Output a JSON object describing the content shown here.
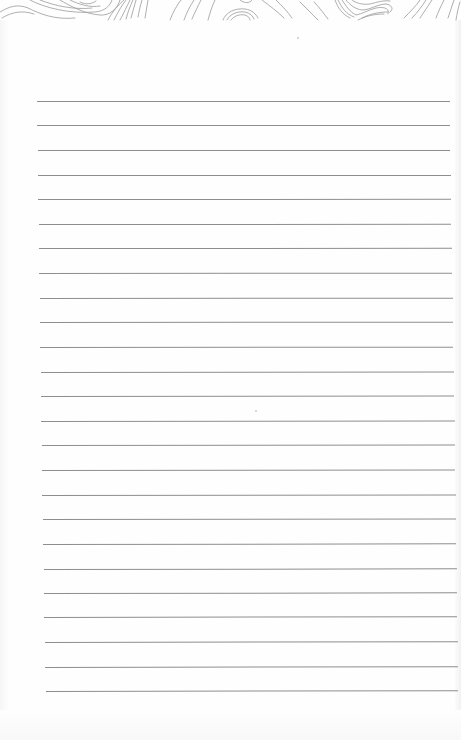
{
  "document": {
    "type": "lined-notebook-page",
    "background_color": "#fefefe",
    "line_color": "#8e8e8e",
    "header_pattern": "topographic-contour-lines",
    "header_pattern_color": "#9a9a9a",
    "ruled_line_count": 25,
    "ruled_lines": [
      {
        "y": 101,
        "x1": 37,
        "x2": 450
      },
      {
        "y": 125,
        "x1": 37,
        "x2": 450
      },
      {
        "y": 150,
        "x1": 38,
        "x2": 450
      },
      {
        "y": 175,
        "x1": 38,
        "x2": 451
      },
      {
        "y": 199,
        "x1": 38,
        "x2": 451
      },
      {
        "y": 224,
        "x1": 39,
        "x2": 451
      },
      {
        "y": 248,
        "x1": 39,
        "x2": 452
      },
      {
        "y": 273,
        "x1": 39,
        "x2": 452
      },
      {
        "y": 298,
        "x1": 40,
        "x2": 453
      },
      {
        "y": 322,
        "x1": 40,
        "x2": 453
      },
      {
        "y": 347,
        "x1": 40,
        "x2": 453
      },
      {
        "y": 372,
        "x1": 41,
        "x2": 454
      },
      {
        "y": 396,
        "x1": 41,
        "x2": 454
      },
      {
        "y": 421,
        "x1": 41,
        "x2": 455
      },
      {
        "y": 445,
        "x1": 42,
        "x2": 455
      },
      {
        "y": 470,
        "x1": 42,
        "x2": 455
      },
      {
        "y": 495,
        "x1": 42,
        "x2": 456
      },
      {
        "y": 519,
        "x1": 43,
        "x2": 456
      },
      {
        "y": 544,
        "x1": 43,
        "x2": 456
      },
      {
        "y": 569,
        "x1": 44,
        "x2": 457
      },
      {
        "y": 593,
        "x1": 44,
        "x2": 457
      },
      {
        "y": 617,
        "x1": 44,
        "x2": 457
      },
      {
        "y": 642,
        "x1": 45,
        "x2": 458
      },
      {
        "y": 667,
        "x1": 45,
        "x2": 458
      },
      {
        "y": 691,
        "x1": 46,
        "x2": 458
      }
    ],
    "specks": [
      {
        "x": 297,
        "y": 37
      },
      {
        "x": 255,
        "y": 410
      }
    ]
  }
}
